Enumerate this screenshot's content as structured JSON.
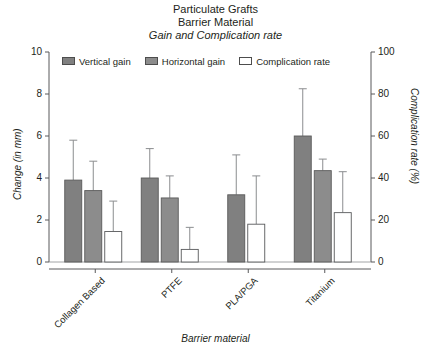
{
  "title": {
    "line1": "Particulate Grafts",
    "line2": "Barrier Material",
    "line3": "Gain and Complication rate"
  },
  "legend": [
    {
      "label": "Vertical gain",
      "swatch": "vertical",
      "color": "#808080",
      "icon": "legend-swatch-filled"
    },
    {
      "label": "Horizontal gain",
      "swatch": "horizontal",
      "color": "#8c8c8c",
      "icon": "legend-swatch-filled"
    },
    {
      "label": "Complication rate",
      "swatch": "complication",
      "color": "#ffffff",
      "icon": "legend-swatch-outline"
    }
  ],
  "axes": {
    "left": {
      "label": "Change (in mm)",
      "ticks": [
        "0",
        "2",
        "4",
        "6",
        "8",
        "10"
      ],
      "min": 0,
      "max": 10
    },
    "right": {
      "label": "Complication rate (%)",
      "ticks": [
        "0",
        "20",
        "40",
        "60",
        "80",
        "100"
      ],
      "min": 0,
      "max": 100
    },
    "x": {
      "label": "Barrier material",
      "categories": [
        "Collagen Based",
        "PTFE",
        "PLA/PGA",
        "Titanium"
      ]
    }
  },
  "chart_data": {
    "type": "bar",
    "subtitle": "Gain and Complication rate",
    "xlabel": "Barrier material",
    "ylabel": "Change (in mm)",
    "y2label": "Complication rate (%)",
    "ylim": [
      0,
      10
    ],
    "y2lim": [
      0,
      100
    ],
    "grid": false,
    "legend_position": "top",
    "categories": [
      "Collagen Based",
      "PTFE",
      "PLA/PGA",
      "Titanium"
    ],
    "series": [
      {
        "name": "Vertical gain",
        "axis": "left",
        "unit": "mm",
        "color": "#808080",
        "values": [
          3.9,
          4.0,
          3.2,
          6.0
        ],
        "error_upper": [
          5.8,
          5.4,
          5.1,
          8.25
        ]
      },
      {
        "name": "Horizontal gain",
        "axis": "left",
        "unit": "mm",
        "color": "#8c8c8c",
        "values": [
          3.4,
          3.05,
          null,
          4.35
        ],
        "error_upper": [
          4.8,
          4.1,
          null,
          4.9
        ]
      },
      {
        "name": "Complication rate",
        "axis": "right",
        "unit": "%",
        "color": "#ffffff",
        "values": [
          14.5,
          6.0,
          18.0,
          23.5
        ],
        "error_upper": [
          29.0,
          16.5,
          41.0,
          43.0
        ]
      }
    ]
  }
}
